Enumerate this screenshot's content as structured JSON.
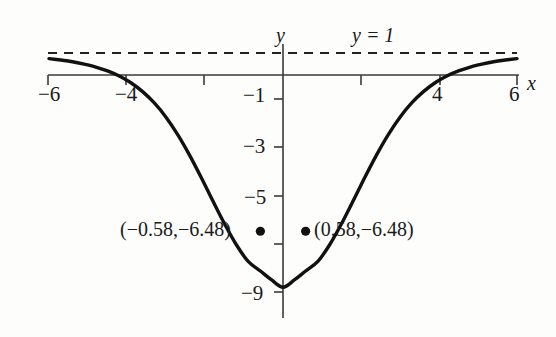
{
  "figure": {
    "axis_labels": {
      "x": "x",
      "y": "y"
    },
    "asymptote_label": "y = 1",
    "point_labels": {
      "left": "(−0.58,−6.48)",
      "right": "(0.58,−6.48)"
    },
    "xticks": {
      "neg6": "−6",
      "neg4": "−4",
      "pos4": "4",
      "pos6": "6"
    },
    "yticks": {
      "neg1": "−1",
      "neg3": "−3",
      "neg5": "−5",
      "neg9": "−9"
    },
    "colors": {
      "curve": "#111111",
      "axis": "#3a3a3a",
      "asymptote": "#222222",
      "background": "#fdfdfc",
      "text": "#1a1a1a"
    }
  },
  "chart_data": {
    "type": "line",
    "title": "",
    "xlabel": "x",
    "ylabel": "y",
    "xlim": [
      -6,
      6
    ],
    "ylim": [
      -9.6,
      1.6
    ],
    "grid": false,
    "legend": "none",
    "xticks": [
      -6,
      -4,
      -2,
      2,
      4,
      6
    ],
    "xtick_labels": [
      "−6",
      "−4",
      "",
      "",
      "4",
      "6"
    ],
    "yticks": [
      -1,
      -3,
      -5,
      -7,
      -9
    ],
    "ytick_labels": [
      "−1",
      "−3",
      "−5",
      "",
      "−9"
    ],
    "asymptote": {
      "type": "horizontal",
      "y": 1,
      "label": "y = 1",
      "style": "dashed"
    },
    "annotations": [
      {
        "label": "(−0.58,−6.48)",
        "x": -0.58,
        "y": -6.48,
        "marker": "dot"
      },
      {
        "label": "(0.58,−6.48)",
        "x": 0.58,
        "y": -6.48,
        "marker": "dot"
      }
    ],
    "series": [
      {
        "name": "curve",
        "x": [
          -6.0,
          -5.7,
          -5.4,
          -5.1,
          -4.8,
          -4.5,
          -4.2,
          -3.9,
          -3.6,
          -3.3,
          -3.0,
          -2.7,
          -2.4,
          -2.1,
          -1.8,
          -1.5,
          -1.2,
          -0.9,
          -0.58,
          -0.3,
          0.0,
          0.3,
          0.58,
          0.9,
          1.2,
          1.5,
          1.8,
          2.1,
          2.4,
          2.7,
          3.0,
          3.3,
          3.6,
          3.9,
          4.2,
          4.5,
          4.8,
          5.1,
          5.4,
          5.7,
          6.0
        ],
        "y": [
          0.68,
          0.62,
          0.55,
          0.45,
          0.33,
          0.17,
          -0.04,
          -0.32,
          -0.69,
          -1.16,
          -1.75,
          -2.47,
          -3.31,
          -4.24,
          -5.22,
          -6.17,
          -7.03,
          -7.72,
          -8.13,
          -8.49,
          -8.8,
          -8.49,
          -8.13,
          -7.72,
          -7.03,
          -6.17,
          -5.22,
          -4.24,
          -3.31,
          -2.47,
          -1.75,
          -1.16,
          -0.69,
          -0.32,
          -0.04,
          0.17,
          0.33,
          0.45,
          0.55,
          0.62,
          0.68
        ]
      }
    ]
  }
}
